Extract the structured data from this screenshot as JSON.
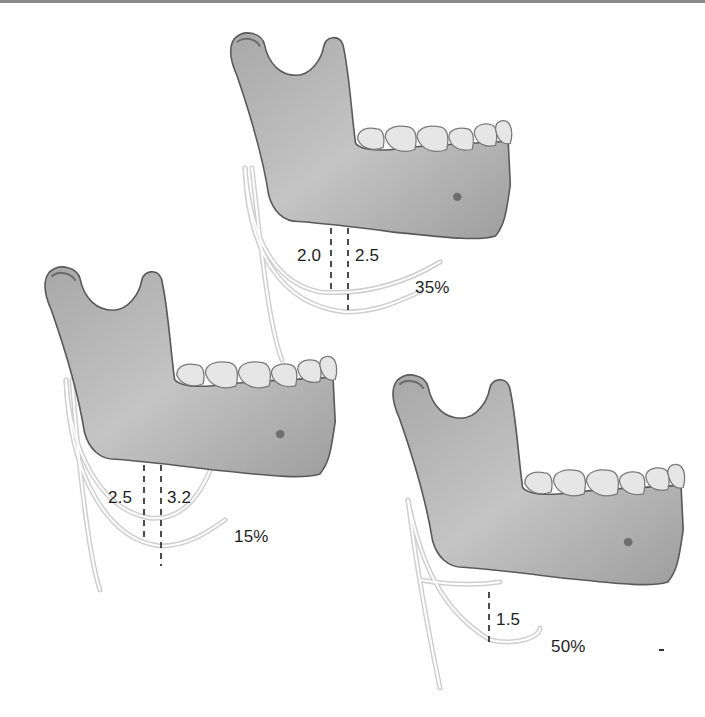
{
  "figure": {
    "panels": [
      {
        "id": "top",
        "measurements": [
          {
            "label": "2.0"
          },
          {
            "label": "2.5"
          }
        ],
        "percentage": "35%"
      },
      {
        "id": "left",
        "measurements": [
          {
            "label": "2.5"
          },
          {
            "label": "3.2"
          }
        ],
        "percentage": "15%"
      },
      {
        "id": "right",
        "measurements": [
          {
            "label": "1.5"
          }
        ],
        "percentage": "50%"
      }
    ],
    "colors": {
      "bone_fill": "#b9b9b9",
      "bone_stroke": "#5a5a5a",
      "tooth_fill": "#e6e6e6",
      "nerve": "#c8c8c8",
      "dashes": "#1e1e1e",
      "text": "#1e1e1e"
    }
  }
}
